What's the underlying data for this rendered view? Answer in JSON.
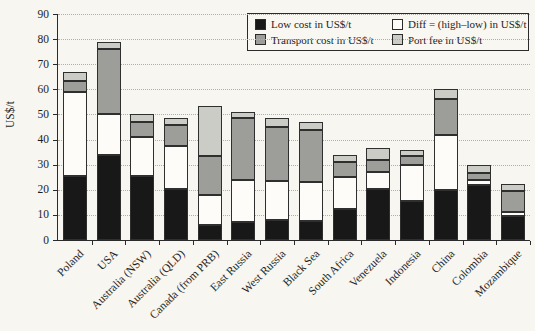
{
  "chart_data": {
    "type": "bar",
    "stacked": true,
    "title": "",
    "xlabel": "",
    "ylabel": "US$/t",
    "ylim": [
      0,
      90
    ],
    "ytick_step": 10,
    "grid": "horizontal-dotted",
    "legend_position": "top-right-inside",
    "legend_display_order": [
      0,
      2,
      1,
      3
    ],
    "categories": [
      "Poland",
      "USA",
      "Australia (NSW)",
      "Australia (QLD)",
      "Canada (from PRB)",
      "East Russia",
      "West Russia",
      "Black Sea",
      "South Africa",
      "Venezuela",
      "Indonesia",
      "China",
      "Colombia",
      "Mozambique"
    ],
    "series": [
      {
        "name": "Low cost in US$/t",
        "color": "#181818",
        "values": [
          25.5,
          34,
          25.5,
          20.5,
          6,
          7,
          8,
          7.5,
          12.5,
          20.5,
          15.5,
          20,
          22,
          9.5
        ]
      },
      {
        "name": "Diff = (high–low) in US$/t",
        "color": "#fdfcf9",
        "values": [
          33.5,
          16,
          15.5,
          17,
          12,
          17,
          15.5,
          15.5,
          12.5,
          6.5,
          14.5,
          22,
          2,
          1.5
        ]
      },
      {
        "name": "Transport cost in US$/t",
        "color": "#9d9d99",
        "values": [
          4.5,
          26,
          6,
          8.5,
          15.5,
          24.5,
          21.5,
          21,
          6,
          5,
          3.5,
          14,
          2.5,
          8.5
        ]
      },
      {
        "name": "Port fee in US$/t",
        "color": "#ccccc6",
        "values": [
          3.5,
          3,
          3,
          2.5,
          20,
          2.5,
          3.5,
          3,
          3,
          4.5,
          2.5,
          4,
          3.5,
          3
        ]
      }
    ],
    "stack_totals": [
      67,
      79,
      50,
      48.5,
      53.5,
      51,
      48.5,
      47,
      34,
      36.5,
      36,
      60,
      30,
      22.5
    ],
    "ytick_labels": [
      "0",
      "10",
      "20",
      "30",
      "40",
      "50",
      "60",
      "70",
      "80",
      "90"
    ]
  }
}
